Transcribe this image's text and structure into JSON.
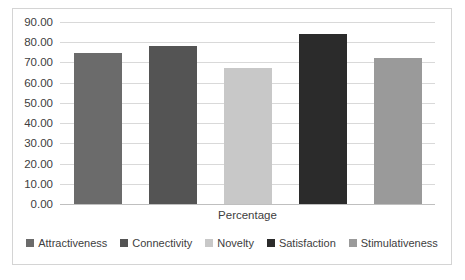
{
  "chart_data": {
    "type": "bar",
    "title": "",
    "subtitle": "",
    "xlabel": "Percentage",
    "ylabel": "",
    "categories": [
      "Percentage"
    ],
    "ylim": [
      0,
      90
    ],
    "ytick_step": 10,
    "ytick_labels": [
      "0.00",
      "10.00",
      "20.00",
      "30.00",
      "40.00",
      "50.00",
      "60.00",
      "70.00",
      "80.00",
      "90.00"
    ],
    "grid": "horizontal",
    "legend_position": "bottom",
    "series": [
      {
        "name": "Attractiveness",
        "values": [
          74.5
        ],
        "color": "#6b6b6b"
      },
      {
        "name": "Connectivity",
        "values": [
          78.0
        ],
        "color": "#545454"
      },
      {
        "name": "Novelty",
        "values": [
          67.5
        ],
        "color": "#c8c8c8"
      },
      {
        "name": "Satisfaction",
        "values": [
          84.0
        ],
        "color": "#2b2b2b"
      },
      {
        "name": "Stimulativeness",
        "values": [
          72.0
        ],
        "color": "#9a9a9a"
      }
    ]
  },
  "colors": {
    "border": "#d4d4d4",
    "gridline": "#d9d9d9",
    "axis": "#bfbfbf",
    "text": "#404040",
    "background": "#ffffff"
  }
}
